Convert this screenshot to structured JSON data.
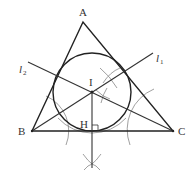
{
  "figure": {
    "points": {
      "A": {
        "label": "A",
        "x": 83,
        "y": 22
      },
      "B": {
        "label": "B",
        "x": 32,
        "y": 131
      },
      "C": {
        "label": "C",
        "x": 173,
        "y": 131
      },
      "I": {
        "label": "I",
        "x": 92,
        "y": 92
      },
      "H": {
        "label": "H",
        "x": 92,
        "y": 131
      }
    },
    "lines": {
      "l1": {
        "label": "l",
        "subscript": "1",
        "from": "B",
        "to": [
          153,
          53
        ]
      },
      "l2": {
        "label": "l",
        "subscript": "2",
        "from": [
          28,
          62
        ],
        "to": "C"
      }
    },
    "incircle": {
      "center": "I",
      "radius": 39
    },
    "labels": {
      "A": "A",
      "B": "B",
      "C": "C",
      "I": "I",
      "H": "H",
      "l1_main": "l",
      "l1_sub": "1",
      "l2_main": "l",
      "l2_sub": "2"
    },
    "colors": {
      "main_line": "#222222",
      "construction_arc": "#777777",
      "text": "#333333",
      "background": "#ffffff"
    }
  }
}
